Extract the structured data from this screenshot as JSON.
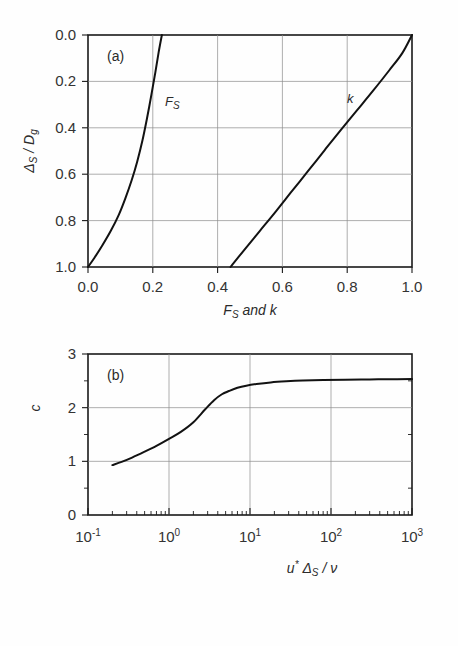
{
  "figure": {
    "background_color": "#fefefe",
    "curve_color": "#121212",
    "grid_color": "#8d8d8d",
    "axis_color": "#1a1a1a"
  },
  "panel_a": {
    "tag": "(a)",
    "xlabel_parts": {
      "f": "F",
      "f_sub": "S",
      "and": " and ",
      "k": "k"
    },
    "ylabel_parts": {
      "delta": "Δ",
      "delta_sub": "S",
      "slash": " / ",
      "d": "D",
      "d_sub": "g"
    },
    "x_ticks": [
      "0.0",
      "0.2",
      "0.4",
      "0.6",
      "0.8",
      "1.0"
    ],
    "y_ticks": [
      "0.0",
      "0.2",
      "0.4",
      "0.6",
      "0.8",
      "1.0"
    ],
    "curve_labels": {
      "fs": "F",
      "fs_sub": "S",
      "k": "k"
    }
  },
  "panel_b": {
    "tag": "(b)",
    "ylabel": "c",
    "xlabel_parts": {
      "u": "u",
      "star": "*",
      "delta": "Δ",
      "delta_sub": "S",
      "slash": " / ",
      "nu": "ν"
    },
    "y_ticks": [
      "0",
      "1",
      "2",
      "3"
    ],
    "x_ticks": [
      {
        "mantissa": "10",
        "exp": "-1"
      },
      {
        "mantissa": "10",
        "exp": "0"
      },
      {
        "mantissa": "10",
        "exp": "1"
      },
      {
        "mantissa": "10",
        "exp": "2"
      },
      {
        "mantissa": "10",
        "exp": "3"
      }
    ]
  },
  "chart_data": [
    {
      "type": "line",
      "id": "panel-a",
      "title": "(a)",
      "xlabel": "F_S and k",
      "ylabel": "Delta_S / D_g",
      "xlim": [
        0.0,
        1.0
      ],
      "ylim": [
        1.0,
        0.0
      ],
      "y_axis_inverted": true,
      "grid": true,
      "xticks": [
        0.0,
        0.2,
        0.4,
        0.6,
        0.8,
        1.0
      ],
      "yticks": [
        0.0,
        0.2,
        0.4,
        0.6,
        0.8,
        1.0
      ],
      "series": [
        {
          "name": "F_S",
          "label_position": [
            0.255,
            0.3
          ],
          "x": [
            0.0,
            0.02,
            0.045,
            0.07,
            0.095,
            0.115,
            0.135,
            0.152,
            0.168,
            0.182,
            0.196,
            0.208,
            0.218,
            0.228
          ],
          "y": [
            1.0,
            0.96,
            0.905,
            0.845,
            0.775,
            0.705,
            0.625,
            0.545,
            0.455,
            0.36,
            0.255,
            0.16,
            0.075,
            0.0
          ]
        },
        {
          "name": "k",
          "label_position": [
            0.8,
            0.275
          ],
          "x": [
            0.44,
            0.48,
            0.53,
            0.58,
            0.63,
            0.68,
            0.73,
            0.78,
            0.83,
            0.88,
            0.93,
            0.97,
            1.0
          ],
          "y": [
            1.0,
            0.93,
            0.845,
            0.76,
            0.672,
            0.585,
            0.497,
            0.41,
            0.325,
            0.24,
            0.152,
            0.078,
            0.0
          ]
        }
      ]
    },
    {
      "type": "line",
      "id": "panel-b",
      "title": "(b)",
      "xlabel": "u* Delta_S / nu",
      "ylabel": "c",
      "xscale": "log",
      "xlim": [
        0.1,
        1000.0
      ],
      "ylim": [
        0,
        3
      ],
      "grid": true,
      "xticks": [
        0.1,
        1.0,
        10.0,
        100.0,
        1000.0
      ],
      "yticks": [
        0,
        1,
        2,
        3
      ],
      "series": [
        {
          "name": "c",
          "x": [
            0.2,
            0.26,
            0.35,
            0.5,
            0.7,
            1.0,
            1.4,
            2.0,
            2.8,
            3.6,
            4.5,
            5.5,
            7.0,
            9.0,
            12.0,
            18.0,
            28.0,
            45.0,
            80.0,
            150.0,
            300.0,
            600.0,
            1000.0
          ],
          "y": [
            0.93,
            0.99,
            1.07,
            1.18,
            1.29,
            1.42,
            1.55,
            1.73,
            1.97,
            2.14,
            2.25,
            2.31,
            2.37,
            2.41,
            2.44,
            2.47,
            2.49,
            2.505,
            2.515,
            2.522,
            2.527,
            2.53,
            2.532
          ]
        }
      ]
    }
  ]
}
